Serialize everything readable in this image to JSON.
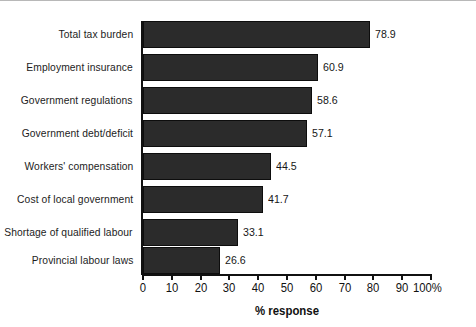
{
  "chart_data": {
    "type": "bar",
    "orientation": "horizontal",
    "title": "",
    "xlabel": "% response",
    "ylabel": "",
    "xlim": [
      0,
      100
    ],
    "grid": false,
    "legend": null,
    "bar_color": "#2b2b2b",
    "categories": [
      "Total tax burden",
      "Employment insurance",
      "Government regulations",
      "Government debt/deficit",
      "Workers' compensation",
      "Cost of local government",
      "Shortage of qualified labour",
      "Provincial labour laws"
    ],
    "values": [
      78.9,
      60.9,
      58.6,
      57.1,
      44.5,
      41.7,
      33.1,
      26.6
    ],
    "value_labels": [
      "78.9",
      "60.9",
      "58.6",
      "57.1",
      "44.5",
      "41.7",
      "33.1",
      "26.6"
    ],
    "xticks": [
      0,
      10,
      20,
      30,
      40,
      50,
      60,
      70,
      80,
      90,
      100
    ],
    "xtick_labels": [
      "0",
      "10",
      "20",
      "30",
      "40",
      "50",
      "60",
      "70",
      "80",
      "90",
      "100%"
    ]
  }
}
